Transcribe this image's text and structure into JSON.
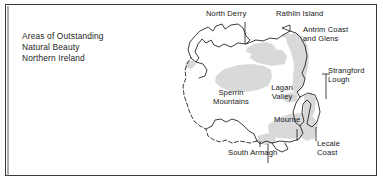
{
  "page": {
    "background": "#ffffff",
    "frame_color": "#3a3a3a",
    "shade_color": "#d9d9d9",
    "coast_color": "#1a1a1a",
    "text_color": "#161616",
    "width": 383,
    "height": 182
  },
  "title_block": {
    "line1": "Areas of Outstanding",
    "line2": "Natural Beauty",
    "line3": "Northern Ireland"
  },
  "map": {
    "region": "Northern Ireland",
    "labels": [
      {
        "id": "north-derry",
        "text": "North Derry",
        "x": 206,
        "y": 13,
        "align": "left",
        "leader": true
      },
      {
        "id": "rathlin-island",
        "text": "Rathlin Island",
        "x": 276,
        "y": 13,
        "align": "left",
        "leader": false
      },
      {
        "id": "antrim-coast",
        "text_1": "Antrim Coast",
        "text_2": "and Glens",
        "x": 303,
        "y": 29,
        "align": "left",
        "leader": false
      },
      {
        "id": "strangford-lough",
        "text_1": "Strangford",
        "text_2": "Lough",
        "x": 328,
        "y": 70,
        "align": "left",
        "leader": true
      },
      {
        "id": "sperrin-mountains",
        "text_1": "Sperrin",
        "text_2": "Mountains",
        "x": 229,
        "y": 92,
        "align": "center",
        "leader": false
      },
      {
        "id": "lagan-valley",
        "text_1": "Lagan",
        "text_2": "Valley",
        "x": 281,
        "y": 87,
        "align": "center",
        "leader": false
      },
      {
        "id": "mourne",
        "text": "Mourne",
        "x": 274,
        "y": 119,
        "align": "left",
        "leader": false
      },
      {
        "id": "south-armagh",
        "text": "South Armagh",
        "x": 228,
        "y": 152,
        "align": "left",
        "leader": true
      },
      {
        "id": "lecale-coast",
        "text_1": "Lecale",
        "text_2": "Coast",
        "x": 317,
        "y": 143,
        "align": "left",
        "leader": true
      }
    ],
    "aonb_areas": [
      "North Derry",
      "Rathlin Island",
      "Antrim Coast and Glens",
      "Strangford Lough",
      "Sperrin Mountains",
      "Lagan Valley",
      "Mourne",
      "South Armagh",
      "Lecale Coast"
    ]
  }
}
